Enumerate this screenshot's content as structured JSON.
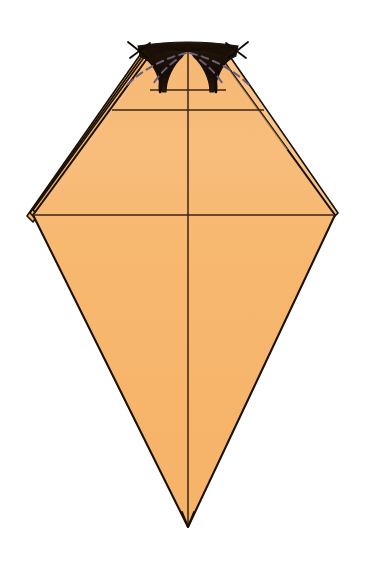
{
  "figure": {
    "kind": "origami-diagram",
    "caption": "",
    "background_color": "#ffffff"
  },
  "colors": {
    "paper_front": "#F7B76E",
    "paper_front_light": "#F9C488",
    "paper_shade": "#EFA85C",
    "paper_dark_pocket": "#1A1008",
    "outline": "#1A1008",
    "crease_line": "#3A2410",
    "dashed_fold": "#6B5A7A",
    "arrow": "#120A04",
    "white": "#ffffff"
  },
  "geometry": {
    "canvas": {
      "width": 368,
      "height": 567
    },
    "model_outline": {
      "top_left_corner": [
        140,
        47
      ],
      "top_right_corner": [
        228,
        47
      ],
      "left_vertex": [
        33,
        215
      ],
      "right_vertex": [
        335,
        215
      ],
      "bottom_point": [
        188,
        527
      ],
      "center_x": 188
    },
    "layer_edges_left": 3,
    "layer_edges_right": 1,
    "horizontal_creases_y": [
      90,
      110,
      215
    ],
    "vertical_crease_x": 188
  },
  "elements": {
    "body_label": "folded paper body",
    "left_layers_label": "stacked layer edges (left)",
    "right_layers_label": "stacked layer edge (right)",
    "top_pocket_left_label": "left dark pocket",
    "top_pocket_right_label": "right dark pocket",
    "center_crease_label": "vertical center crease",
    "mid_crease_label": "horizontal mid crease",
    "upper_crease_label": "upper horizontal crease",
    "dashed_fold_label": "valley fold guide lines",
    "arrow_left_label": "left fold arrow",
    "arrow_right_label": "right fold arrow",
    "tip_label": "bottom tip"
  },
  "annotations": {
    "step_number": "",
    "note_text": ""
  }
}
